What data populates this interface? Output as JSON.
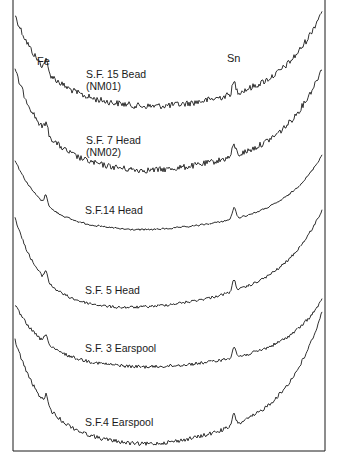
{
  "chart_data": {
    "type": "line",
    "title": "",
    "xlabel": "",
    "ylabel": "",
    "grid": false,
    "legend": "none",
    "peak_annotations": [
      {
        "label": "Fe",
        "x": 46
      },
      {
        "label": "Sn",
        "x": 234
      }
    ],
    "series": [
      {
        "name": "S.F. 15 Bead",
        "sub": "(NM01)",
        "start_y": 15,
        "fe_y": 72,
        "min_y": 108,
        "min_x": 125,
        "sn_y": 68,
        "end_y": 10,
        "noise": 3.2,
        "label_x": 86,
        "label_y": 68
      },
      {
        "name": "S.F. 7 Head",
        "sub": "(NM02)",
        "start_y": 70,
        "fe_y": 124,
        "min_y": 172,
        "min_x": 120,
        "sn_y": 141,
        "end_y": 68,
        "noise": 3.0,
        "label_x": 86,
        "label_y": 134
      },
      {
        "name": "S.F.14 Head",
        "sub": "",
        "start_y": 160,
        "fe_y": 209,
        "min_y": 231,
        "min_x": 115,
        "sn_y": 208,
        "end_y": 155,
        "noise": 0.9,
        "label_x": 85,
        "label_y": 204
      },
      {
        "name": "S.F. 5 Head",
        "sub": "",
        "start_y": 217,
        "fe_y": 281,
        "min_y": 309,
        "min_x": 100,
        "sn_y": 279,
        "end_y": 210,
        "noise": 1.4,
        "label_x": 85,
        "label_y": 284
      },
      {
        "name": "S.F. 3 Earspool",
        "sub": "",
        "start_y": 305,
        "fe_y": 342,
        "min_y": 368,
        "min_x": 120,
        "sn_y": 333,
        "end_y": 300,
        "noise": 1.6,
        "label_x": 85,
        "label_y": 342
      },
      {
        "name": "S.F.4 Earspool",
        "sub": "",
        "start_y": 340,
        "fe_y": 405,
        "min_y": 446,
        "min_x": 120,
        "sn_y": 398,
        "end_y": 312,
        "noise": 2.0,
        "label_x": 85,
        "label_y": 416
      }
    ],
    "frame": {
      "left": 13,
      "right": 325,
      "bottom": 451,
      "top": 0,
      "stroke": "#1a1a1a"
    }
  },
  "annotations": {
    "fe": "Fe",
    "sn": "Sn"
  }
}
